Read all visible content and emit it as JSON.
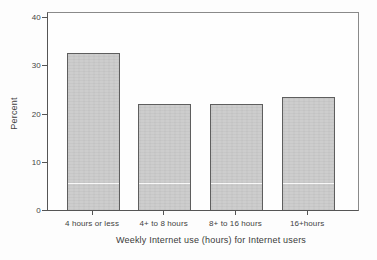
{
  "chart_data": {
    "type": "bar",
    "categories": [
      "4 hours or less",
      "4+ to 8 hours",
      "8+ to 16 hours",
      "16+hours"
    ],
    "values": [
      32.5,
      22,
      22,
      23.5
    ],
    "xlabel": "Weekly Internet use (hours) for Internet users",
    "ylabel": "Percent",
    "ylim": [
      0,
      40
    ],
    "yticks": [
      0,
      10,
      20,
      30,
      40
    ],
    "grid": false,
    "legend": null,
    "colors": {
      "bar_fill": "#cbcbcb",
      "bar_border": "#5e5e5e",
      "axis": "#555555",
      "plot_border": "#8a8a8a",
      "text": "#3b3b3b",
      "background": "#fdfdfd"
    }
  }
}
